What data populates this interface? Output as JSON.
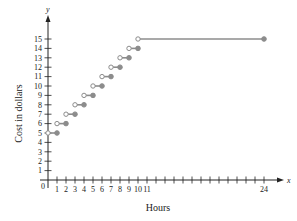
{
  "chart_data": {
    "type": "line",
    "subtype": "step",
    "title": "",
    "xlabel": "Hours",
    "ylabel": "Cost in dollars",
    "x_axis_var": "x",
    "y_axis_var": "y",
    "origin_label": "0",
    "xlim": [
      0,
      24
    ],
    "ylim": [
      0,
      15
    ],
    "x_tick_labels": [
      "1",
      "2",
      "3",
      "4",
      "5",
      "6",
      "7",
      "8",
      "9",
      "10",
      "11",
      "24"
    ],
    "x_tick_values": [
      1,
      2,
      3,
      4,
      5,
      6,
      7,
      8,
      9,
      10,
      11,
      24
    ],
    "x_minor_ticks": [
      12,
      13,
      14,
      15,
      16,
      17,
      18,
      19,
      20,
      21,
      22,
      23
    ],
    "y_tick_labels": [
      "1",
      "2",
      "3",
      "4",
      "5",
      "6",
      "7",
      "8",
      "9",
      "10",
      "11",
      "12",
      "13",
      "14",
      "15"
    ],
    "y_tick_values": [
      1,
      2,
      3,
      4,
      5,
      6,
      7,
      8,
      9,
      10,
      11,
      12,
      13,
      14,
      15
    ],
    "grid": false,
    "legend": "none",
    "series": [
      {
        "name": "Cost",
        "segments": [
          {
            "x_start": 0,
            "x_end": 1,
            "y": 5,
            "start": "open",
            "end": "closed"
          },
          {
            "x_start": 1,
            "x_end": 2,
            "y": 6,
            "start": "open",
            "end": "closed"
          },
          {
            "x_start": 2,
            "x_end": 3,
            "y": 7,
            "start": "open",
            "end": "closed"
          },
          {
            "x_start": 3,
            "x_end": 4,
            "y": 8,
            "start": "open",
            "end": "closed"
          },
          {
            "x_start": 4,
            "x_end": 5,
            "y": 9,
            "start": "open",
            "end": "closed"
          },
          {
            "x_start": 5,
            "x_end": 6,
            "y": 10,
            "start": "open",
            "end": "closed"
          },
          {
            "x_start": 6,
            "x_end": 7,
            "y": 11,
            "start": "open",
            "end": "closed"
          },
          {
            "x_start": 7,
            "x_end": 8,
            "y": 12,
            "start": "open",
            "end": "closed"
          },
          {
            "x_start": 8,
            "x_end": 9,
            "y": 13,
            "start": "open",
            "end": "closed"
          },
          {
            "x_start": 9,
            "x_end": 10,
            "y": 14,
            "start": "open",
            "end": "closed"
          },
          {
            "x_start": 10,
            "x_end": 24,
            "y": 15,
            "start": "open",
            "end": "closed"
          }
        ]
      }
    ],
    "colors": {
      "axis": "#222222",
      "series": "#8c8c8c"
    }
  }
}
